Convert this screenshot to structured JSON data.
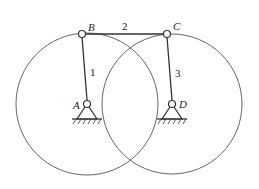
{
  "diagram": {
    "type": "four-bar linkage",
    "joints": {
      "A": {
        "label": "A",
        "x": 87,
        "y": 104,
        "fixed": true
      },
      "B": {
        "label": "B",
        "x": 82,
        "y": 34,
        "fixed": false
      },
      "C": {
        "label": "C",
        "x": 167,
        "y": 34,
        "fixed": false
      },
      "D": {
        "label": "D",
        "x": 172,
        "y": 104,
        "fixed": true
      }
    },
    "links": [
      {
        "label": "1",
        "from": "A",
        "to": "B"
      },
      {
        "label": "2",
        "from": "B",
        "to": "C"
      },
      {
        "label": "3",
        "from": "D",
        "to": "C"
      }
    ],
    "circles": [
      {
        "center": "A",
        "r": 71
      },
      {
        "center": "D",
        "r": 70
      }
    ],
    "colors": {
      "line": "#333333",
      "circle": "#555555"
    }
  }
}
